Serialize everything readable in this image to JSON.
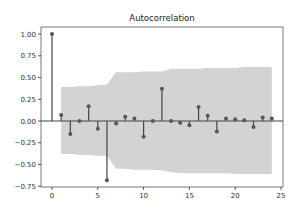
{
  "chart_data": {
    "type": "stem",
    "title": "Autocorrelation",
    "xlabel": "",
    "ylabel": "",
    "xlim": [
      -1.2,
      25.2
    ],
    "ylim": [
      -0.76,
      1.08
    ],
    "xticks": [
      0,
      5,
      10,
      15,
      20,
      25
    ],
    "xtick_labels": [
      "0",
      "5",
      "10",
      "15",
      "20",
      "25"
    ],
    "yticks": [
      1.0,
      0.75,
      0.5,
      0.25,
      0.0,
      -0.25,
      -0.5,
      -0.75
    ],
    "ytick_labels": [
      "1.00",
      "0.75",
      "0.50",
      "0.25",
      "0.00",
      "−0.25",
      "−0.50",
      "−0.75"
    ],
    "grid": false,
    "legend": null,
    "lags": [
      0,
      1,
      2,
      3,
      4,
      5,
      6,
      7,
      8,
      9,
      10,
      11,
      12,
      13,
      14,
      15,
      16,
      17,
      18,
      19,
      20,
      21,
      22,
      23,
      24
    ],
    "values": [
      1.0,
      0.07,
      -0.15,
      0.0,
      0.17,
      -0.09,
      -0.68,
      -0.03,
      0.05,
      0.03,
      -0.18,
      0.0,
      0.37,
      0.0,
      -0.02,
      -0.05,
      0.16,
      0.06,
      -0.12,
      0.03,
      0.02,
      0.01,
      -0.07,
      0.04,
      0.03
    ],
    "confidence_band": {
      "lags": [
        1,
        2,
        3,
        4,
        5,
        6,
        7,
        8,
        9,
        10,
        11,
        12,
        13,
        14,
        15,
        16,
        17,
        18,
        19,
        20,
        21,
        22,
        23,
        24
      ],
      "upper": [
        0.39,
        0.39,
        0.4,
        0.4,
        0.41,
        0.42,
        0.56,
        0.56,
        0.56,
        0.57,
        0.57,
        0.57,
        0.6,
        0.6,
        0.6,
        0.6,
        0.61,
        0.61,
        0.61,
        0.61,
        0.62,
        0.62,
        0.62,
        0.62
      ],
      "lower": [
        -0.38,
        -0.38,
        -0.39,
        -0.39,
        -0.4,
        -0.4,
        -0.55,
        -0.55,
        -0.56,
        -0.56,
        -0.56,
        -0.57,
        -0.59,
        -0.6,
        -0.6,
        -0.6,
        -0.6,
        -0.6,
        -0.6,
        -0.61,
        -0.61,
        -0.61,
        -0.61,
        -0.61
      ]
    },
    "colors": {
      "stem": "#444444",
      "marker": "#555555",
      "band": "#d3d3d3",
      "axis": "#333333",
      "zero_line": "#444444"
    }
  }
}
